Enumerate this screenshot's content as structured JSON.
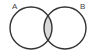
{
  "diagram": {
    "type": "venn",
    "sets": [
      {
        "label": "A",
        "cx": 31,
        "cy": 28,
        "r": 21
      },
      {
        "label": "B",
        "cx": 65,
        "cy": 28,
        "r": 21
      }
    ],
    "intersection": {
      "shaded": true,
      "fill": "#d9d9d9"
    },
    "stroke": "#333333",
    "background": "#ffffff"
  }
}
